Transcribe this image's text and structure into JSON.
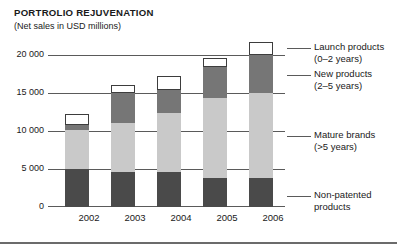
{
  "chart_data": {
    "type": "bar",
    "subtype": "stacked-bar",
    "title": "PORTROLIO REJUVENATION",
    "subtitle": "(Net sales in USD millions)",
    "xlabel": "",
    "ylabel": "",
    "categories": [
      "2002",
      "2003",
      "2004",
      "2005",
      "2006"
    ],
    "ylim": [
      0,
      20000
    ],
    "ytick_values": [
      0,
      5000,
      10000,
      15000,
      20000
    ],
    "ytick_labels": [
      "0",
      "5 000",
      "10 000",
      "15 000",
      "20 000"
    ],
    "grid": true,
    "legend_position": "right-callouts",
    "series": [
      {
        "name": "Non-patented products",
        "legend_label": "Non-patented",
        "legend_label_line2": "products",
        "color": "#4a4a4a",
        "values": [
          5000,
          4600,
          4600,
          3800,
          3800
        ]
      },
      {
        "name": "Mature brands (>5 years)",
        "legend_label": "Mature brands",
        "legend_label_line2": "(>5 years)",
        "color": "#c9c9c9",
        "values": [
          5100,
          6400,
          7800,
          10500,
          11200
        ]
      },
      {
        "name": "New products (2-5 years)",
        "legend_label": "New products",
        "legend_label_line2": "(2–5 years)",
        "color": "#767676",
        "values": [
          700,
          3900,
          3000,
          4100,
          5000
        ]
      },
      {
        "name": "Launch products (0-2 years)",
        "legend_label": "Launch products",
        "legend_label_line2": "(0–2 years)",
        "color": "#ffffff",
        "values": [
          1400,
          1000,
          1800,
          1200,
          1700
        ]
      }
    ],
    "totals": [
      12200,
      15900,
      17200,
      19600,
      21700
    ]
  },
  "chart": {
    "title": "PORTROLIO REJUVENATION",
    "subtitle": "(Net sales in USD millions)"
  },
  "yaxis": {
    "labels": [
      "20 000",
      "15 000",
      "10 000",
      "5 000",
      "0"
    ]
  },
  "xaxis": {
    "labels": [
      "2002",
      "2003",
      "2004",
      "2005",
      "2006"
    ]
  },
  "legend": {
    "items": [
      {
        "line1": "Launch products",
        "line2": "(0–2 years)"
      },
      {
        "line1": "New products",
        "line2": "(2–5 years)"
      },
      {
        "line1": "Mature brands",
        "line2": "(>5 years)"
      },
      {
        "line1": "Non-patented",
        "line2": "products"
      }
    ]
  }
}
